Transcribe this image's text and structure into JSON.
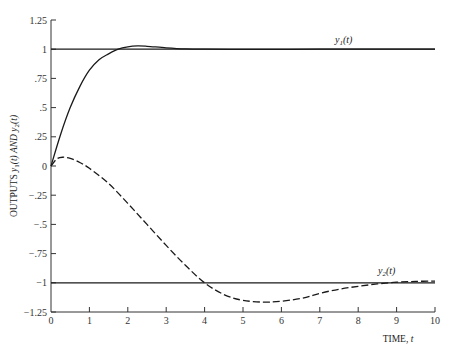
{
  "chart_data": {
    "type": "line",
    "title": "",
    "xlabel": "TIME, t",
    "ylabel": "OUTPUTS y1(t) AND y2(t)",
    "xlim": [
      0,
      10
    ],
    "ylim": [
      -1.25,
      1.25
    ],
    "grid": false,
    "legend_position": "inline labels",
    "x_ticks": [
      0,
      1,
      2,
      3,
      4,
      5,
      6,
      7,
      8,
      9,
      10
    ],
    "x_tick_labels": [
      "0",
      "1",
      "2",
      "3",
      "4",
      "5",
      "6",
      "7",
      "8",
      "9",
      "10"
    ],
    "y_ticks": [
      1.25,
      1,
      0.75,
      0.5,
      0.25,
      0,
      -0.25,
      -0.5,
      -0.75,
      -1,
      -1.25
    ],
    "y_tick_labels": [
      "1.25",
      "1",
      ".75",
      ".5",
      ".25",
      "0",
      "−.25",
      "−.5",
      "−.75",
      "−1",
      "−1.25"
    ],
    "reference_lines": [
      {
        "name": "setpoint-y1",
        "y": 1,
        "x_range": [
          0,
          10
        ],
        "style": "solid"
      },
      {
        "name": "setpoint-y2",
        "y": -1,
        "x_range": [
          0,
          10
        ],
        "style": "solid"
      }
    ],
    "series": [
      {
        "name": "y1(t)",
        "style": "solid",
        "label_position": {
          "t": 7.2,
          "value": 1.06
        },
        "x": [
          0,
          0.25,
          0.5,
          0.75,
          1,
          1.25,
          1.5,
          1.75,
          2,
          2.25,
          2.5,
          3,
          3.5,
          4,
          5,
          6,
          7,
          8,
          9,
          10
        ],
        "values": [
          0,
          0.27,
          0.5,
          0.68,
          0.82,
          0.91,
          0.96,
          1.0,
          1.02,
          1.028,
          1.025,
          1.012,
          1.003,
          1.0,
          0.998,
          0.999,
          1.0,
          1.0,
          1.0,
          1.0
        ]
      },
      {
        "name": "y2(t)",
        "style": "dashed",
        "label_position": {
          "t": 8.8,
          "value": -0.94
        },
        "x": [
          0,
          0.15,
          0.3,
          0.5,
          0.75,
          1,
          1.5,
          2,
          2.5,
          3,
          3.5,
          4,
          4.5,
          5,
          5.7,
          6.5,
          7,
          7.5,
          8,
          8.5,
          9,
          9.5,
          10
        ],
        "values": [
          0,
          0.06,
          0.075,
          0.065,
          0.03,
          -0.02,
          -0.15,
          -0.32,
          -0.5,
          -0.68,
          -0.85,
          -1.0,
          -1.1,
          -1.15,
          -1.165,
          -1.135,
          -1.09,
          -1.055,
          -1.03,
          -1.01,
          -0.995,
          -0.988,
          -0.985
        ]
      }
    ]
  },
  "axes": {
    "x_title_main": "TIME, ",
    "x_title_var": "t",
    "y_title_main": "OUTPUTS ",
    "y_title_y1": "y",
    "y_title_sub1": "1",
    "y_title_mid": "(t) AND ",
    "y_title_y2": "y",
    "y_title_sub2": "2",
    "y_title_end": "(t)"
  },
  "labels": {
    "y1_base": "y",
    "y1_sub": "1",
    "y1_arg": "(t)",
    "y2_base": "y",
    "y2_sub": "2",
    "y2_arg": "(t)"
  },
  "colors": {
    "line": "#1a1a1a",
    "axis": "#333333",
    "background": "#ffffff"
  }
}
